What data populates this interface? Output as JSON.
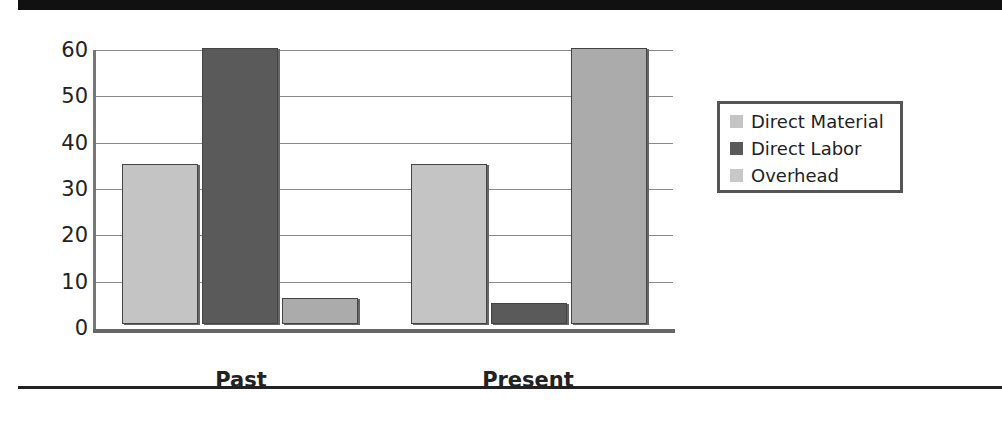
{
  "chart_data": {
    "type": "bar",
    "title": "",
    "xlabel": "",
    "ylabel": "",
    "categories": [
      "Past",
      "Present"
    ],
    "series": [
      {
        "name": "Direct Material",
        "values": [
          35,
          35
        ],
        "color": "#c4c4c4"
      },
      {
        "name": "Direct Labor",
        "values": [
          60,
          5
        ],
        "color": "#5a5a5a"
      },
      {
        "name": "Overhead",
        "values": [
          6,
          60
        ],
        "color": "#ababab"
      }
    ],
    "ylim": [
      0,
      60
    ],
    "yticks": [
      "0",
      "10",
      "20",
      "30",
      "40",
      "50",
      "60"
    ],
    "grid": true,
    "legend_position": "right"
  },
  "legend": {
    "items": [
      {
        "label": "Direct Material",
        "color": "#c4c4c4"
      },
      {
        "label": "Direct Labor",
        "color": "#5a5a5a"
      },
      {
        "label": "Overhead",
        "color": "#c8c8c8"
      }
    ]
  }
}
